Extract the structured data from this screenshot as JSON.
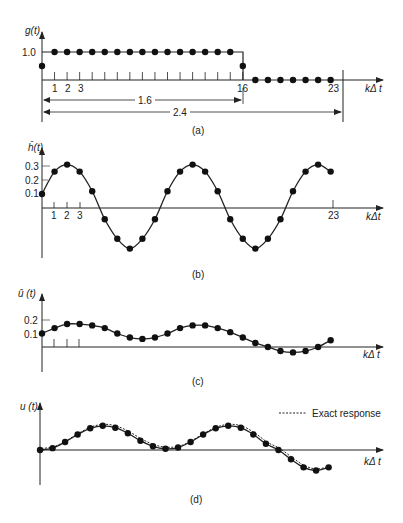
{
  "chart_data": [
    {
      "id": "a",
      "type": "scatter",
      "ylabel": "g(t)",
      "xlabel": "kΔt",
      "caption": "(a)",
      "y_ticks": [
        "1.0"
      ],
      "x_ticks": [
        "1",
        "2",
        "3",
        "16",
        "23"
      ],
      "x": [
        0,
        1,
        2,
        3,
        4,
        5,
        6,
        7,
        8,
        9,
        10,
        11,
        12,
        13,
        14,
        15,
        16,
        17,
        18,
        19,
        20,
        21,
        22,
        23
      ],
      "values": [
        0.5,
        1,
        1,
        1,
        1,
        1,
        1,
        1,
        1,
        1,
        1,
        1,
        1,
        1,
        1,
        1,
        0.5,
        0,
        0,
        0,
        0,
        0,
        0,
        0
      ],
      "annotations": [
        {
          "text": "1.6",
          "from_k": 0,
          "to_k": 16
        },
        {
          "text": "2.4",
          "from_k": 0,
          "to_k": 24
        }
      ]
    },
    {
      "id": "b",
      "type": "line",
      "ylabel": "ĥ(t)",
      "xlabel": "kΔt",
      "caption": "(b)",
      "y_ticks": [
        "0.3",
        "0.2",
        "0.1"
      ],
      "x_ticks": [
        "1",
        "2",
        "3",
        "23"
      ],
      "x": [
        0,
        1,
        2,
        3,
        4,
        5,
        6,
        7,
        8,
        9,
        10,
        11,
        12,
        13,
        14,
        15,
        16,
        17,
        18,
        19,
        20,
        21,
        22,
        23
      ],
      "values": [
        0.1,
        0.26,
        0.31,
        0.26,
        0.12,
        -0.08,
        -0.22,
        -0.29,
        -0.22,
        -0.08,
        0.12,
        0.26,
        0.31,
        0.26,
        0.12,
        -0.08,
        -0.22,
        -0.29,
        -0.22,
        -0.08,
        0.12,
        0.26,
        0.31,
        0.26
      ]
    },
    {
      "id": "c",
      "type": "line",
      "ylabel": "û (t)",
      "xlabel": "kΔt",
      "caption": "(c)",
      "y_ticks": [
        "0.2",
        "0.1"
      ],
      "x_ticks": [],
      "x": [
        0,
        1,
        2,
        3,
        4,
        5,
        6,
        7,
        8,
        9,
        10,
        11,
        12,
        13,
        14,
        15,
        16,
        17,
        18,
        19,
        20,
        21,
        22,
        23
      ],
      "values": [
        0.1,
        0.14,
        0.17,
        0.17,
        0.16,
        0.14,
        0.1,
        0.07,
        0.06,
        0.07,
        0.1,
        0.14,
        0.16,
        0.16,
        0.14,
        0.11,
        0.07,
        0.03,
        0.0,
        -0.03,
        -0.04,
        -0.03,
        0.0,
        0.05
      ]
    },
    {
      "id": "d",
      "type": "line",
      "ylabel": "u (t)",
      "xlabel": "kΔt",
      "caption": "(d)",
      "legend": [
        "Exact response"
      ],
      "x": [
        0,
        1,
        2,
        3,
        4,
        5,
        6,
        7,
        8,
        9,
        10,
        11,
        12,
        13,
        14,
        15,
        16,
        17,
        18,
        19,
        20,
        21,
        22,
        23
      ],
      "values": [
        0.0,
        0.03,
        0.13,
        0.25,
        0.35,
        0.39,
        0.36,
        0.27,
        0.15,
        0.06,
        0.02,
        0.04,
        0.13,
        0.25,
        0.35,
        0.39,
        0.36,
        0.25,
        0.1,
        0.0,
        -0.15,
        -0.28,
        -0.33,
        -0.28,
        0.0
      ]
    }
  ],
  "labels": {
    "a_y": "g(t)",
    "a_y_tick": "1.0",
    "a_k1": "1",
    "a_k2": "2",
    "a_k3": "3",
    "a_k16": "16",
    "a_k23": "23",
    "a_x": "kΔ t",
    "a_dim1": "1.6",
    "a_dim2": "2.4",
    "a_caption": "(a)",
    "b_y": "ĥ(t)",
    "b_t3": "0.3",
    "b_t2": "0.2",
    "b_t1": "0.1",
    "b_k1": "1",
    "b_k2": "2",
    "b_k3": "3",
    "b_k23": "23",
    "b_x": "kΔt",
    "b_caption": "(b)",
    "c_y": "û (t)",
    "c_t2": "0.2",
    "c_t1": "0.1",
    "c_x": "kΔ t",
    "c_caption": "(c)",
    "d_y": "u (t)",
    "d_x": "kΔ t",
    "d_legend": "Exact response",
    "d_caption": "(d)"
  }
}
